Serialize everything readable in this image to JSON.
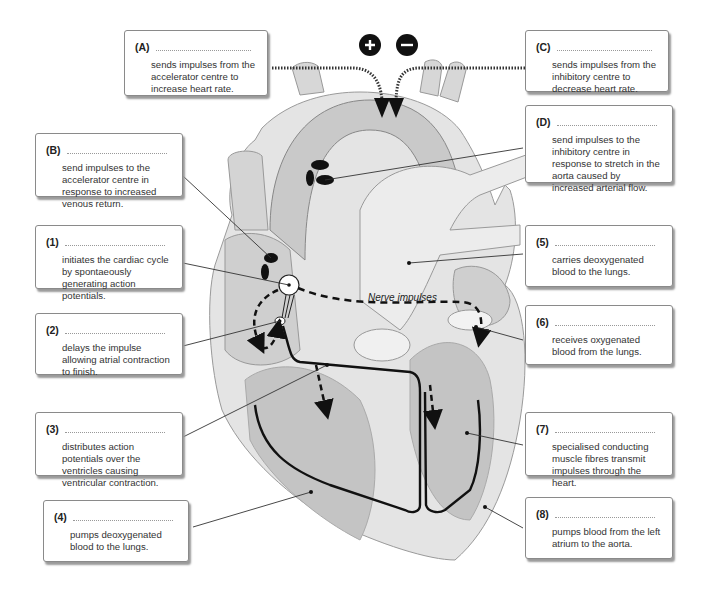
{
  "diagram": {
    "nerve_label": "Nerve impulses",
    "signs": {
      "plus": "+",
      "minus": "−"
    }
  },
  "labels": [
    {
      "id": "A",
      "tag": "(A)",
      "text": "sends impulses from the accelerator centre to increase heart rate."
    },
    {
      "id": "B",
      "tag": "(B)",
      "text": "send impulses to the accelerator centre in response to increased venous return."
    },
    {
      "id": "C",
      "tag": "(C)",
      "text": "sends impulses from the inhibitory centre to decrease heart rate."
    },
    {
      "id": "D",
      "tag": "(D)",
      "text": "send impulses to the inhibitory centre in response to stretch in the aorta caused by increased arterial flow."
    },
    {
      "id": "1",
      "tag": "(1)",
      "text": "initiates the cardiac cycle by spontaeously generating action potentials."
    },
    {
      "id": "2",
      "tag": "(2)",
      "text": "delays the impulse allowing atrial contraction to finish."
    },
    {
      "id": "3",
      "tag": "(3)",
      "text": "distributes action potentials over the ventricles causing ventricular contraction."
    },
    {
      "id": "4",
      "tag": "(4)",
      "text": "pumps deoxygenated blood to the lungs."
    },
    {
      "id": "5",
      "tag": "(5)",
      "text": "carries deoxygenated blood to the lungs."
    },
    {
      "id": "6",
      "tag": "(6)",
      "text": "receives oxygenated blood from the lungs."
    },
    {
      "id": "7",
      "tag": "(7)",
      "text": "specialised conducting muscle fibres transmit impulses through the heart."
    },
    {
      "id": "8",
      "tag": "(8)",
      "text": "pumps blood from the left atrium to the aorta."
    }
  ]
}
